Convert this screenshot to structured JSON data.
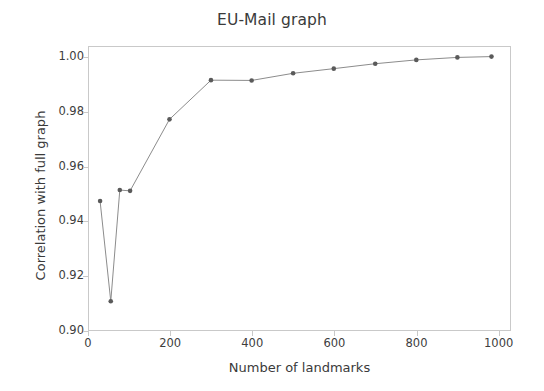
{
  "chart_data": {
    "type": "line",
    "title": "EU-Mail graph",
    "xlabel": "Number of landmarks",
    "ylabel": "Correlation with full graph",
    "xlim": [
      0,
      1030
    ],
    "ylim": [
      0.9,
      1.004
    ],
    "grid": false,
    "legend": null,
    "marker": "circle",
    "line_color": "#8c8c8c",
    "marker_color": "#5a5a5a",
    "xticks": [
      0,
      200,
      400,
      600,
      800,
      1000
    ],
    "xtick_labels": [
      "0",
      "200",
      "400",
      "600",
      "800",
      "1000"
    ],
    "yticks": [
      0.9,
      0.92,
      0.94,
      0.96,
      0.98,
      1.0
    ],
    "ytick_labels": [
      "0.90",
      "0.92",
      "0.94",
      "0.96",
      "0.98",
      "1.00"
    ],
    "x": [
      27,
      53,
      75,
      100,
      196,
      297,
      396,
      497,
      596,
      697,
      797,
      897,
      980
    ],
    "y": [
      0.9478,
      0.9112,
      0.9518,
      0.9515,
      0.9776,
      0.9919,
      0.9918,
      0.9944,
      0.9961,
      0.9979,
      0.9993,
      1.0002,
      1.0005
    ],
    "series": [
      {
        "name": "correlation",
        "points": [
          {
            "x": 27,
            "y": 0.9478
          },
          {
            "x": 53,
            "y": 0.9112
          },
          {
            "x": 75,
            "y": 0.9518
          },
          {
            "x": 100,
            "y": 0.9515
          },
          {
            "x": 196,
            "y": 0.9776
          },
          {
            "x": 297,
            "y": 0.9919
          },
          {
            "x": 396,
            "y": 0.9918
          },
          {
            "x": 497,
            "y": 0.9944
          },
          {
            "x": 596,
            "y": 0.9961
          },
          {
            "x": 697,
            "y": 0.9979
          },
          {
            "x": 797,
            "y": 0.9993
          },
          {
            "x": 897,
            "y": 1.0002
          },
          {
            "x": 980,
            "y": 1.0005
          }
        ]
      }
    ]
  }
}
